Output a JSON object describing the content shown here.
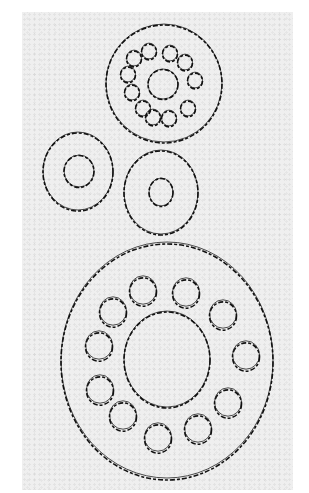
{
  "figure": {
    "colors": {
      "sheet": "#efefef",
      "line": "#111111",
      "page": "#ffffff"
    },
    "parts": [
      {
        "id": "small-flange-top",
        "outer": {
          "cx": 164,
          "cy": 83,
          "rx": 58,
          "ry": 59
        },
        "hub": {
          "cx": 163,
          "cy": 84,
          "rx": 15,
          "ry": 15
        },
        "hole_r": 7.5,
        "holes": [
          [
            149,
            51
          ],
          [
            170,
            53
          ],
          [
            185,
            62
          ],
          [
            134,
            58
          ],
          [
            128,
            74
          ],
          [
            195,
            80
          ],
          [
            132,
            92
          ],
          [
            188,
            108
          ],
          [
            143,
            108
          ],
          [
            153,
            117
          ],
          [
            169,
            118
          ]
        ]
      },
      {
        "id": "washer-left",
        "outer": {
          "cx": 78,
          "cy": 171,
          "rx": 35,
          "ry": 39
        },
        "hub": {
          "cx": 79,
          "cy": 171,
          "rx": 15,
          "ry": 16
        },
        "hole_r": 0,
        "holes": []
      },
      {
        "id": "washer-right",
        "outer": {
          "cx": 161,
          "cy": 192,
          "rx": 37,
          "ry": 42
        },
        "hub": {
          "cx": 161,
          "cy": 192,
          "rx": 12,
          "ry": 14
        },
        "hole_r": 0,
        "holes": []
      },
      {
        "id": "large-flange-bottom",
        "outer": {
          "cx": 167,
          "cy": 360,
          "rx": 106,
          "ry": 118
        },
        "hub": {
          "cx": 167,
          "cy": 359,
          "rx": 43,
          "ry": 48
        },
        "hole_r": 13.5,
        "holes": [
          [
            143,
            290
          ],
          [
            186,
            292
          ],
          [
            113,
            311
          ],
          [
            223,
            314
          ],
          [
            99,
            345
          ],
          [
            246,
            355
          ],
          [
            100,
            389
          ],
          [
            228,
            402
          ],
          [
            123,
            415
          ],
          [
            198,
            428
          ],
          [
            158,
            437
          ]
        ]
      }
    ]
  }
}
